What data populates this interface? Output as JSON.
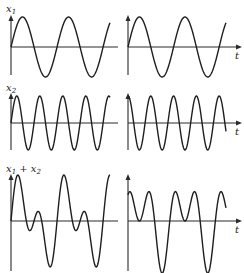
{
  "chart_data": {
    "type": "line",
    "title": "",
    "rows": [
      {
        "label": "x1",
        "label_main": "x",
        "label_sub": "1",
        "ylim": [
          -1.2,
          1.2
        ]
      },
      {
        "label": "x2",
        "label_main": "x",
        "label_sub": "2",
        "ylim": [
          -1.2,
          1.2
        ]
      },
      {
        "label": "x1 + x2",
        "label_main": "x",
        "label_sub": "1",
        "label_plus": " + x",
        "label_sub2": "2",
        "ylim": [
          -1.9,
          1.9
        ]
      }
    ],
    "xlabel": "t",
    "xlim": [
      0,
      2.15
    ],
    "columns": [
      {
        "name": "left",
        "series": [
          {
            "name": "x1",
            "amplitude": 1.0,
            "cycles_per_unit": 1.0,
            "phase_deg": 0
          },
          {
            "name": "x2",
            "amplitude": 1.0,
            "cycles_per_unit": 2.0,
            "phase_deg": 0
          },
          {
            "name": "x1 + x2",
            "sum_of": [
              "x1",
              "x2"
            ]
          }
        ]
      },
      {
        "name": "right",
        "series": [
          {
            "name": "x1",
            "amplitude": 1.0,
            "cycles_per_unit": 1.0,
            "phase_deg": 0
          },
          {
            "name": "x2",
            "amplitude": 1.0,
            "cycles_per_unit": 2.0,
            "phase_deg": 90
          },
          {
            "name": "x1 + x2",
            "sum_of": [
              "x1",
              "x2"
            ]
          }
        ]
      }
    ],
    "grid": false,
    "legend": "none"
  }
}
